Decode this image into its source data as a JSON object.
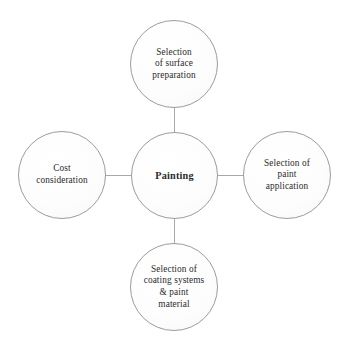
{
  "diagram": {
    "type": "hub-and-spoke",
    "stroke_color": "#9c9c9c",
    "connector_color": "#a8a8a8",
    "text_color": "#2b2b2b",
    "background_color": "#ffffff",
    "center": {
      "id": "painting",
      "label": "Painting"
    },
    "nodes": [
      {
        "id": "surface-preparation",
        "position": "top",
        "label": "Selection\nof surface\npreparation"
      },
      {
        "id": "paint-application",
        "position": "right",
        "label": "Selection of\npaint\napplication"
      },
      {
        "id": "coating-systems",
        "position": "bottom",
        "label": "Selection of\ncoating systems\n& paint\nmaterial"
      },
      {
        "id": "cost-consideration",
        "position": "left",
        "label": "Cost\nconsideration"
      }
    ],
    "connectors": [
      {
        "id": "center-to-top",
        "orientation": "vertical"
      },
      {
        "id": "center-to-right",
        "orientation": "horizontal"
      },
      {
        "id": "center-to-bottom",
        "orientation": "vertical"
      },
      {
        "id": "center-to-left",
        "orientation": "horizontal"
      }
    ]
  }
}
